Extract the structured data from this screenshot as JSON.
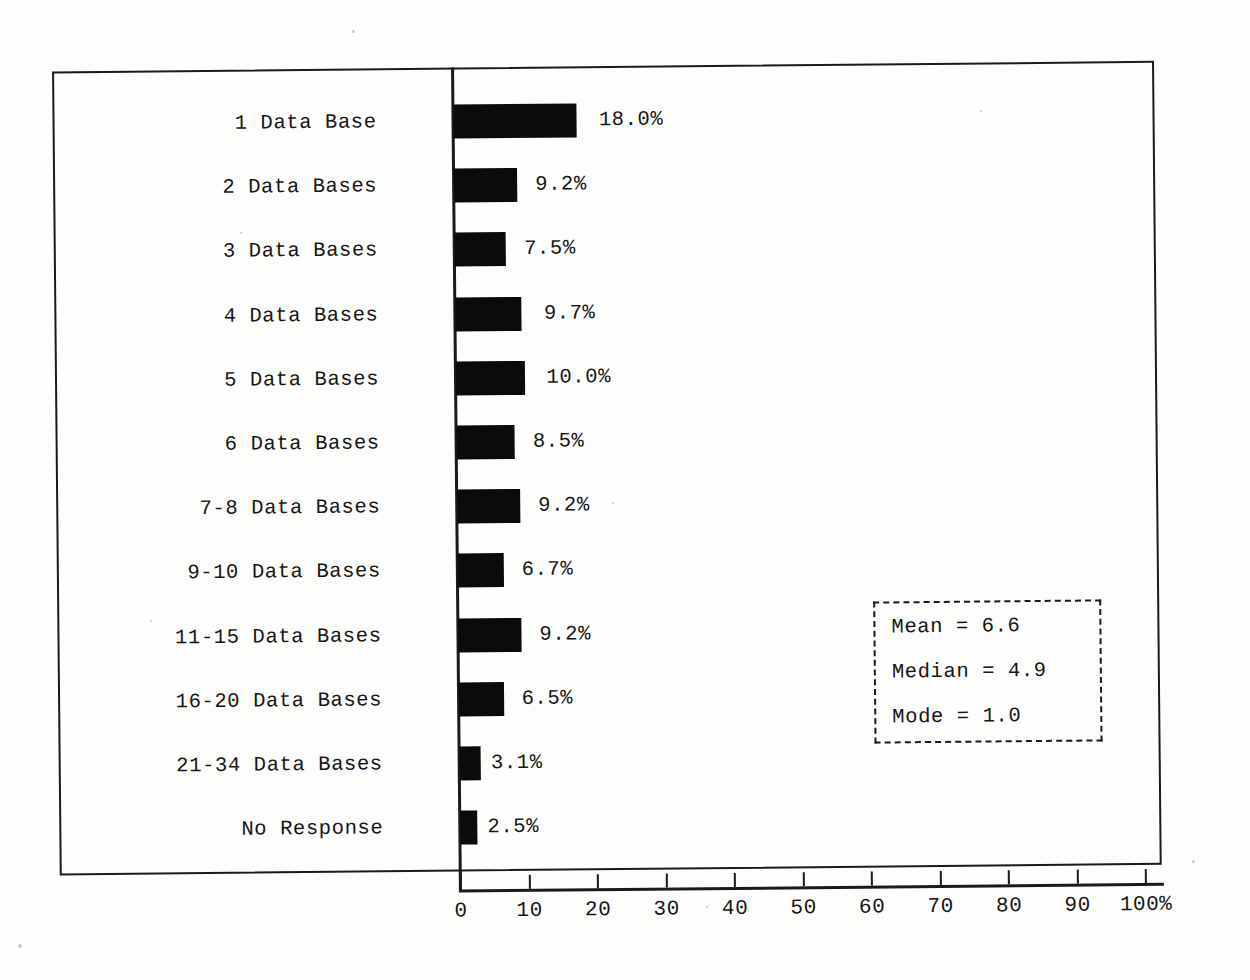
{
  "chart_data": {
    "type": "bar",
    "orientation": "horizontal",
    "title": "",
    "subtitle": "",
    "xlabel": "",
    "ylabel": "",
    "xlim": [
      0,
      100
    ],
    "grid": false,
    "legend": null,
    "categories": [
      "1 Data Base",
      "2 Data Bases",
      "3 Data Bases",
      "4 Data Bases",
      "5 Data Bases",
      "6 Data Bases",
      "7-8 Data Bases",
      "9-10 Data Bases",
      "11-15 Data Bases",
      "16-20 Data Bases",
      "21-34 Data Bases",
      "No Response"
    ],
    "values": [
      18.0,
      9.2,
      7.5,
      9.7,
      10.0,
      8.5,
      9.2,
      6.7,
      9.2,
      6.5,
      3.1,
      2.5
    ],
    "value_labels": [
      "18.0%",
      "9.2%",
      "7.5%",
      "9.7%",
      "10.0%",
      "8.5%",
      "9.2%",
      "6.7%",
      "9.2%",
      "6.5%",
      "3.1%",
      "2.5%"
    ],
    "xticks": [
      0,
      10,
      20,
      30,
      40,
      50,
      60,
      70,
      80,
      90,
      100
    ],
    "xticklabels": [
      "0",
      "10",
      "20",
      "30",
      "40",
      "50",
      "60",
      "70",
      "80",
      "90",
      "100%"
    ],
    "bar_color": "#0b0b0b",
    "axis_color": "#1a1a1a",
    "background_color": "#ffffff"
  },
  "stats_box": {
    "border_style": "dashed",
    "lines": [
      {
        "label": "Mean",
        "text": "Mean   = 6.6",
        "value": 6.6
      },
      {
        "label": "Median",
        "text": "Median = 4.9",
        "value": 4.9
      },
      {
        "label": "Mode",
        "text": "Mode   = 1.0",
        "value": 1.0
      }
    ]
  }
}
